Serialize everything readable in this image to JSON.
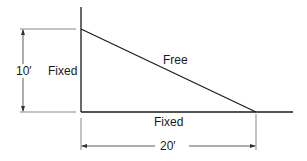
{
  "diagram": {
    "labels": {
      "left_boundary": "Fixed",
      "top_boundary": "Free",
      "bottom_boundary": "Fixed",
      "height_dimension": "10′",
      "width_dimension": "20′"
    },
    "line_color": "#1a1a1a",
    "dimension_color": "#333333"
  }
}
